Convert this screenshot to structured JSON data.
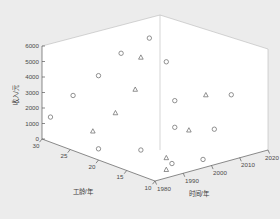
{
  "figure": {
    "background_color": "#ececec",
    "pane_color": "#ffffff",
    "axis_color": "#5a5a5a",
    "marker_color": "#6d6d6d"
  },
  "chart_data": {
    "type": "scatter",
    "projection": "3d",
    "title": "",
    "xlabel": "时间/年",
    "ylabel": "工龄/年",
    "zlabel": "收入/元",
    "xlim": [
      1980,
      2020
    ],
    "ylim": [
      10,
      30
    ],
    "zlim": [
      0,
      6000
    ],
    "xticks": [
      1980,
      1990,
      2000,
      2010,
      2020
    ],
    "yticks": [
      30,
      25,
      20,
      15,
      10
    ],
    "zticks": [
      0,
      1000,
      2000,
      3000,
      4000,
      5000,
      6000
    ],
    "xtick_labels": [
      "1980",
      "1990",
      "2000",
      "2010",
      "2020"
    ],
    "ytick_labels": [
      "30",
      "25",
      "20",
      "15",
      "10"
    ],
    "ztick_labels": [
      "0",
      "1000",
      "2000",
      "3000",
      "4000",
      "5000",
      "6000"
    ],
    "grid": false,
    "legend": false,
    "series": [
      {
        "name": "circle-series",
        "marker": "circle",
        "points": [
          {
            "x": 1981,
            "y": 29,
            "z": 1500
          },
          {
            "x": 1983,
            "y": 26,
            "z": 3200
          },
          {
            "x": 1988,
            "y": 24,
            "z": 4500
          },
          {
            "x": 1990,
            "y": 21,
            "z": 6250
          },
          {
            "x": 1996,
            "y": 19,
            "z": 7200
          },
          {
            "x": 1989,
            "y": 17,
            "z": 600
          },
          {
            "x": 1984,
            "y": 22,
            "z": 250
          },
          {
            "x": 1992,
            "y": 13,
            "z": 120
          },
          {
            "x": 1999,
            "y": 16,
            "z": 1700
          },
          {
            "x": 2003,
            "y": 18,
            "z": 2950
          },
          {
            "x": 2006,
            "y": 21,
            "z": 4900
          },
          {
            "x": 2001,
            "y": 12,
            "z": 70
          },
          {
            "x": 2009,
            "y": 14,
            "z": 1350
          },
          {
            "x": 2019,
            "y": 16,
            "z": 2800
          }
        ]
      },
      {
        "name": "triangle-series",
        "marker": "triangle",
        "points": [
          {
            "x": 1984,
            "y": 23,
            "z": 1250
          },
          {
            "x": 1988,
            "y": 21,
            "z": 2500
          },
          {
            "x": 1993,
            "y": 20,
            "z": 3900
          },
          {
            "x": 1999,
            "y": 22,
            "z": 5400
          },
          {
            "x": 1992,
            "y": 14,
            "z": 350
          },
          {
            "x": 1988,
            "y": 12,
            "z": 60
          },
          {
            "x": 2002,
            "y": 15,
            "z": 1500
          },
          {
            "x": 2012,
            "y": 17,
            "z": 3000
          }
        ]
      }
    ]
  },
  "axes": {
    "z_tick_labels": [
      "6000",
      "5000",
      "4000",
      "3000",
      "2000",
      "1000",
      "0"
    ],
    "y_tick_labels": [
      "30",
      "25",
      "20",
      "15",
      "10"
    ],
    "x_tick_labels": [
      "1980",
      "1990",
      "2000",
      "2010",
      "2020"
    ],
    "z_title": "收入/元",
    "y_title": "工龄/年",
    "x_title": "时间/年"
  }
}
